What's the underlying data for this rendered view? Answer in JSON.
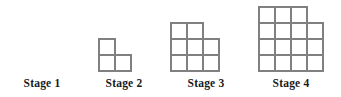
{
  "figure": {
    "background_color": "#ffffff",
    "cell_fill_color": "#ffffff",
    "cell_stroke_color": "#808080",
    "label_color": "#1a1a1a",
    "cell_size_px": 16,
    "stages": [
      {
        "label": "Stage 1",
        "stage_number": 1,
        "square_count": 0,
        "rows_top_to_bottom": [],
        "label_center_x": 42,
        "label_top": 77,
        "figure_left": 42,
        "figure_top": 70
      },
      {
        "label": "Stage 2",
        "stage_number": 2,
        "square_count": 3,
        "rows_top_to_bottom": [
          1,
          2
        ],
        "label_center_x": 124,
        "label_top": 77,
        "figure_left": 98,
        "figure_top": 38
      },
      {
        "label": "Stage 3",
        "stage_number": 3,
        "square_count": 8,
        "rows_top_to_bottom": [
          2,
          3,
          3
        ],
        "label_center_x": 206,
        "label_top": 77,
        "figure_left": 170,
        "figure_top": 22
      },
      {
        "label": "Stage 4",
        "stage_number": 4,
        "square_count": 15,
        "rows_top_to_bottom": [
          3,
          4,
          4,
          4
        ],
        "label_center_x": 291,
        "label_top": 77,
        "figure_left": 258,
        "figure_top": 6
      }
    ]
  },
  "chart_data": {
    "type": "bar",
    "xlabel": "",
    "ylabel": "",
    "categories": [
      "Stage 1",
      "Stage 2",
      "Stage 3",
      "Stage 4"
    ],
    "values": [
      0,
      3,
      8,
      15
    ],
    "ylim": [
      0,
      16
    ],
    "grid": false,
    "legend": null
  }
}
